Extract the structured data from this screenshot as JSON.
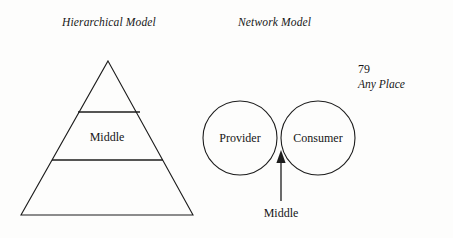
{
  "page": {
    "background_color": "#fdfdfc",
    "ink_color": "#1a1a1a",
    "width": 453,
    "height": 238
  },
  "titles": {
    "hierarchical": "Hierarchical Model",
    "network": "Network Model"
  },
  "page_meta": {
    "page_number": "79",
    "place": "Any Place"
  },
  "hierarchical_diagram": {
    "name": "pyramid",
    "apex": {
      "x": 108,
      "y": 61
    },
    "base_left": {
      "x": 21,
      "y": 215
    },
    "base_right": {
      "x": 193,
      "y": 215
    },
    "tiers": [
      {
        "label": "",
        "divider_y": 112,
        "divider_left_x": 78,
        "divider_right_x": 140
      },
      {
        "label": "Middle",
        "divider_y": 160,
        "divider_left_x": 52,
        "divider_right_x": 163
      }
    ],
    "middle_label": "Middle",
    "middle_label_pos": {
      "x": 107,
      "y": 141
    }
  },
  "network_diagram": {
    "name": "two-overlapping-circles",
    "circles": [
      {
        "label": "Provider",
        "cx": 240,
        "cy": 138,
        "r": 37
      },
      {
        "label": "Consumer",
        "cx": 318,
        "cy": 138,
        "r": 37
      }
    ],
    "arrow": {
      "label": "Middle",
      "tip": {
        "x": 281,
        "y": 151
      },
      "tail": {
        "x": 281,
        "y": 201
      },
      "label_pos": {
        "x": 281,
        "y": 217
      }
    }
  }
}
